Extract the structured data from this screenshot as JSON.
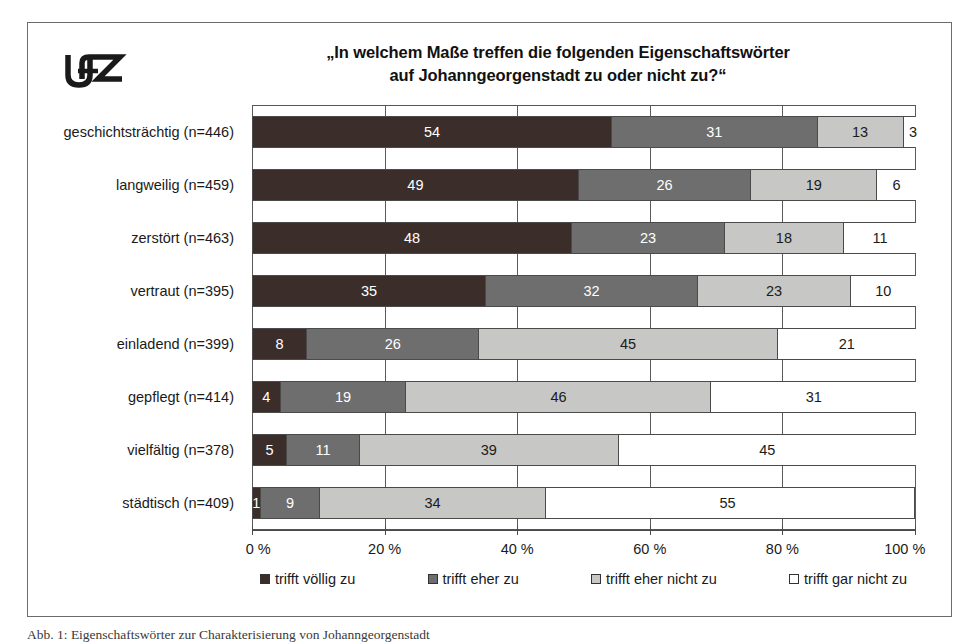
{
  "logo": {
    "name": "ufz-logo",
    "text": "UFZ"
  },
  "title": {
    "line1": "„In welchem Maße treffen die folgenden Eigenschaftswörter",
    "line2": "auf Johanngeorgenstadt zu oder nicht zu?“"
  },
  "caption": "Abb. 1:  Eigenschaftswörter zur Charakterisierung von Johanngeorgenstadt",
  "axis": {
    "ticks": [
      "0 %",
      "20 %",
      "40 %",
      "60 %",
      "80 %",
      "100 %"
    ],
    "tick_values": [
      0,
      20,
      40,
      60,
      80,
      100
    ],
    "min": 0,
    "max": 100
  },
  "legend": [
    {
      "label": "trifft völlig zu",
      "color": "#3b2e2a"
    },
    {
      "label": "trifft eher zu",
      "color": "#6e6e6e"
    },
    {
      "label": "trifft eher nicht zu",
      "color": "#c7c7c5"
    },
    {
      "label": "trifft gar nicht zu",
      "color": "#ffffff"
    }
  ],
  "chart_data": {
    "type": "bar",
    "orientation": "horizontal",
    "stacked": true,
    "normalized_percent": true,
    "title": "„In welchem Maße treffen die folgenden Eigenschaftswörter auf Johanngeorgenstadt zu oder nicht zu?“",
    "xlabel": "",
    "ylabel": "",
    "xlim": [
      0,
      100
    ],
    "grid": true,
    "legend_position": "bottom",
    "categories": [
      "geschichtsträchtig (n=446)",
      "langweilig (n=459)",
      "zerstört (n=463)",
      "vertraut (n=395)",
      "einladend (n=399)",
      "gepflegt (n=414)",
      "vielfältig (n=378)",
      "städtisch (n=409)"
    ],
    "series": [
      {
        "name": "trifft völlig zu",
        "color": "#3b2e2a",
        "values": [
          54,
          49,
          48,
          35,
          8,
          4,
          5,
          1
        ]
      },
      {
        "name": "trifft eher zu",
        "color": "#6e6e6e",
        "values": [
          31,
          26,
          23,
          32,
          26,
          19,
          11,
          9
        ]
      },
      {
        "name": "trifft eher nicht zu",
        "color": "#c7c7c5",
        "values": [
          13,
          19,
          18,
          23,
          45,
          46,
          39,
          34
        ]
      },
      {
        "name": "trifft gar nicht zu",
        "color": "#ffffff",
        "values": [
          3,
          6,
          11,
          10,
          21,
          31,
          45,
          55
        ]
      }
    ]
  }
}
